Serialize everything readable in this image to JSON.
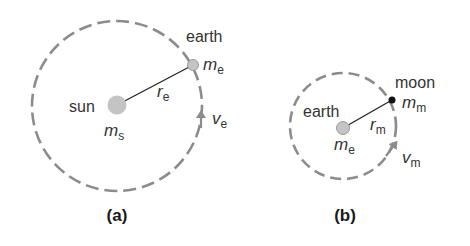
{
  "colors": {
    "orbit": "#8c8c8c",
    "body_fill": "#c4c4c4",
    "body_stroke": "#9a9a9a",
    "moon": "#111111",
    "radius_line": "#222222",
    "text": "#333333"
  },
  "panel_a": {
    "label": "(a)",
    "central_body": {
      "name": "sun",
      "mass_symbol": "m",
      "mass_sub": "s"
    },
    "orbiting_body": {
      "name": "earth",
      "mass_symbol": "m",
      "mass_sub": "e"
    },
    "radius": {
      "symbol": "r",
      "sub": "e"
    },
    "velocity": {
      "symbol": "v",
      "sub": "e"
    }
  },
  "panel_b": {
    "label": "(b)",
    "central_body": {
      "name": "earth",
      "mass_symbol": "m",
      "mass_sub": "e"
    },
    "orbiting_body": {
      "name": "moon",
      "mass_symbol": "m",
      "mass_sub": "m"
    },
    "radius": {
      "symbol": "r",
      "sub": "m"
    },
    "velocity": {
      "symbol": "v",
      "sub": "m"
    }
  }
}
